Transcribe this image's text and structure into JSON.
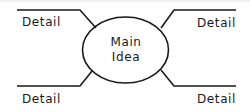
{
  "diagram": {
    "type": "spider-map",
    "center": {
      "line1": "Main",
      "line2": "Idea"
    },
    "branches": [
      {
        "position": "top-left",
        "label": "Detail"
      },
      {
        "position": "top-right",
        "label": "Detail"
      },
      {
        "position": "bottom-left",
        "label": "Detail"
      },
      {
        "position": "bottom-right",
        "label": "Detail"
      }
    ],
    "colors": {
      "stroke": "#1a1a1a",
      "background": "#ffffff",
      "top_band": "#f0f0f0"
    }
  }
}
